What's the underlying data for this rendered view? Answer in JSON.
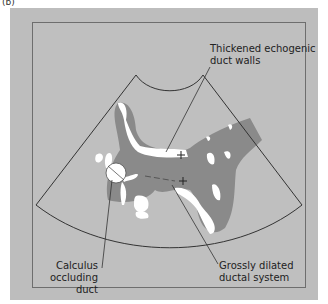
{
  "figure": {
    "panel_label": "(b)",
    "colors": {
      "background": "#bdbdbd",
      "frame_border": "#6e6e6e",
      "dilated_duct": "#8a8a8a",
      "echogenic_wall": "#ffffff",
      "outline": "#333333"
    },
    "labels": {
      "walls_line1": "Thickened echogenic",
      "walls_line2": "duct walls",
      "calculus_line1": "Calculus",
      "calculus_line2": "occluding duct",
      "ductal_line1": "Grossly dilated",
      "ductal_line2": "ductal system"
    },
    "icons": {
      "cursor_markers": "crosshair-plus"
    }
  }
}
